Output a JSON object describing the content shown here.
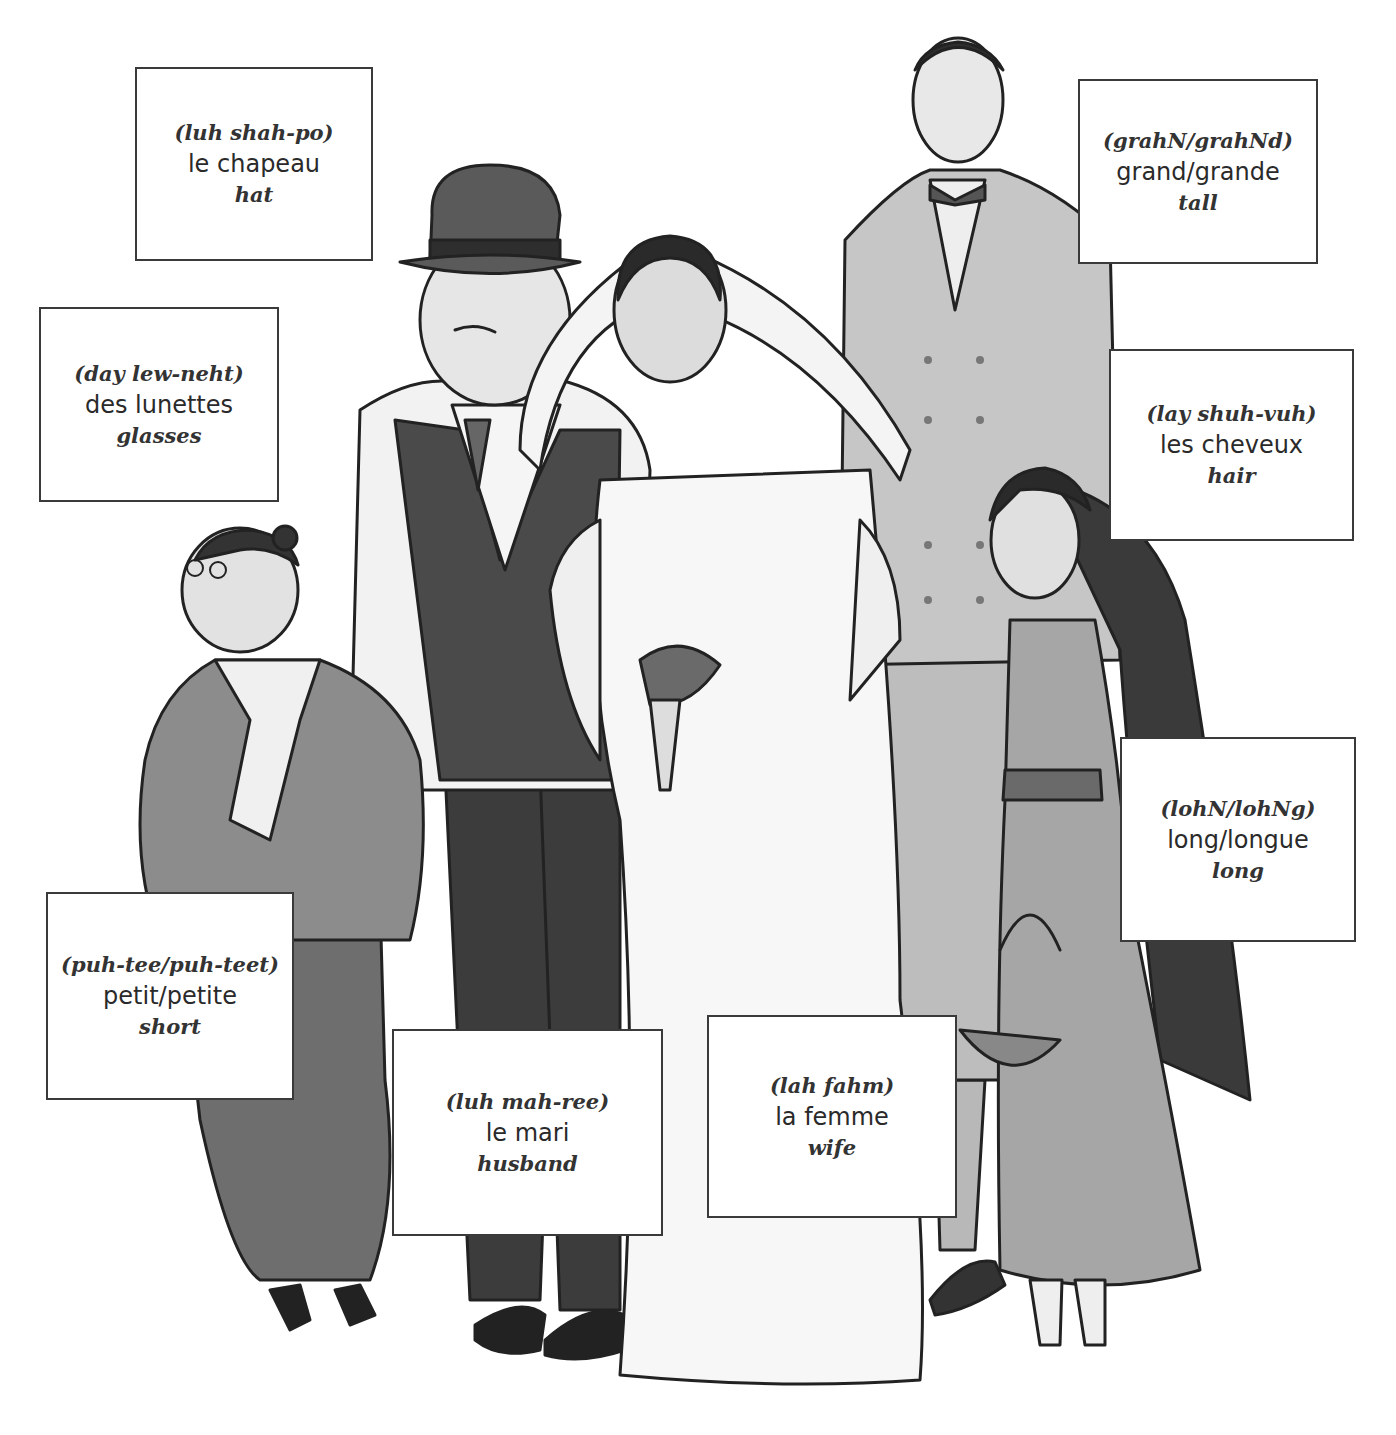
{
  "page": {
    "type": "vocabulary-illustration",
    "background": "#ffffff"
  },
  "illustration": {
    "description": "Grayscale drawing of a wedding party: short woman with glasses, husband in hat and vest, bride with veil and bouquet, tall man in double-breasted jacket, girl with long hair holding a flower basket",
    "figures": [
      "short-woman-with-glasses",
      "husband-in-hat",
      "bride",
      "tall-man",
      "girl-with-long-hair"
    ]
  },
  "labels": [
    {
      "id": "hat",
      "pronunciation": "(luh shah-po)",
      "french": "le chapeau",
      "english": "hat",
      "box": {
        "x": 135,
        "y": 67,
        "w": 238,
        "h": 194
      }
    },
    {
      "id": "tall",
      "pronunciation": "(grahN/grahNd)",
      "french": "grand/grande",
      "english": "tall",
      "box": {
        "x": 1078,
        "y": 79,
        "w": 240,
        "h": 185
      }
    },
    {
      "id": "glasses",
      "pronunciation": "(day lew-neht)",
      "french": "des lunettes",
      "english": "glasses",
      "box": {
        "x": 39,
        "y": 307,
        "w": 240,
        "h": 195
      }
    },
    {
      "id": "hair",
      "pronunciation": "(lay shuh-vuh)",
      "french": "les cheveux",
      "english": "hair",
      "box": {
        "x": 1109,
        "y": 349,
        "w": 245,
        "h": 192
      }
    },
    {
      "id": "long",
      "pronunciation": "(lohN/lohNg)",
      "french": "long/longue",
      "english": "long",
      "box": {
        "x": 1120,
        "y": 737,
        "w": 236,
        "h": 205
      }
    },
    {
      "id": "short",
      "pronunciation": "(puh-tee/puh-teet)",
      "french": "petit/petite",
      "english": "short",
      "box": {
        "x": 46,
        "y": 892,
        "w": 248,
        "h": 208
      }
    },
    {
      "id": "husband",
      "pronunciation": "(luh mah-ree)",
      "french": "le mari",
      "english": "husband",
      "box": {
        "x": 392,
        "y": 1029,
        "w": 271,
        "h": 207
      }
    },
    {
      "id": "wife",
      "pronunciation": "(lah fahm)",
      "french": "la femme",
      "english": "wife",
      "box": {
        "x": 707,
        "y": 1015,
        "w": 250,
        "h": 203
      }
    }
  ]
}
